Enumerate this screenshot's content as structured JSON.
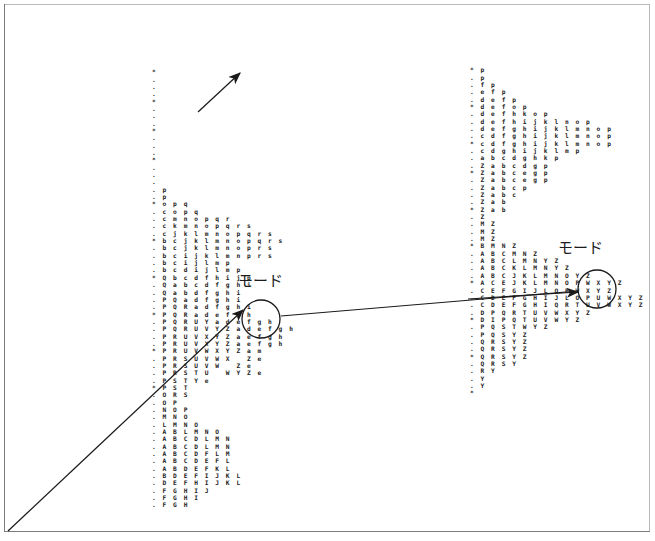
{
  "figure": {
    "title": "",
    "background_color": "#ffffff",
    "ink_color": "#1a1a1a",
    "frame_color": "#7d7d7d"
  },
  "annotations": {
    "left_label": "モード",
    "right_label": "モード",
    "left_label_romaji": "mōdo",
    "right_label_romaji": "mōdo"
  },
  "markers": {
    "left_circle": {
      "cx": 261,
      "cy": 319,
      "r": 19
    },
    "right_circle": {
      "cx": 597,
      "cy": 289,
      "r": 19
    },
    "leader_line": {
      "x1": 281,
      "y1": 316,
      "x2": 578,
      "y2": 291
    },
    "diagonal_arrow": {
      "x1": 8,
      "y1": 531,
      "x2": 243,
      "y2": 310
    },
    "upper_arrow": {
      "x1": 198,
      "y1": 112,
      "x2": 240,
      "y2": 73
    },
    "right_arrow": {
      "x1": 468,
      "y1": 299,
      "x2": 578,
      "y2": 292
    }
  },
  "ascii_maps": {
    "left": {
      "name": "left-mode-map",
      "char_rows": [
        "*",
        ".",
        ".",
        ".",
        "*",
        ".",
        ".",
        ".",
        "*",
        ".",
        ".",
        ".",
        "*",
        ".",
        ".",
        ".",
        ". p",
        ". p",
        "* o p q",
        ". c o p q",
        ". c m n o p q r",
        ". c k m n o p q r s",
        ". c j k l m n o p q r s",
        "* b c j k l m n o p q r s",
        ". b c j k l m n o p r s",
        ". b c i j k l m n p r s",
        ". b c i j l m p",
        ". b c d i j l m p",
        "* Q b c d f h i j p",
        ". Q a b c d f g h i",
        ". Q a b d f g h i",
        ". P Q a d f g h i",
        ". P Q R a d f g h i",
        "* P Q R a d e f g h",
        ". P Q R U Y a d e f g h",
        ". P Q R U V Y Z a d e f g h",
        ". P R U V X Y Z a e f g h",
        ". P R U V X Y Z a e f g h",
        "* P R U V W X Y Z a m",
        ". P R S U V W X   Z e",
        ". P R S U V W   Z e",
        ". P R S T U   W Y Z e",
        ". P S T Y e",
        "* P S T",
        ". O R S",
        ". O P",
        ". N O P",
        ". M N O",
        ". L M N O",
        ". A B L M N O",
        ". A B C D L M N",
        ". A B C D L M N",
        ". A B C D F L M",
        ". A B C D E F L",
        ". A B D E F K L",
        ". B D E F I J K L",
        ". D E F H I J K L",
        ". F G H I J",
        ". F G H I",
        ". F G H"
      ]
    },
    "right": {
      "name": "right-mode-map",
      "char_rows": [
        "* p",
        ". p",
        ". f p",
        ". e f p",
        ". d e f p",
        "* d e f o p",
        ". d e f h k o p",
        ". d e f h i j k l n o p",
        ". d e f g h i j k l m n o p",
        ". c d f g h i j k l m n o p",
        "* c d f g h i j k l m n o p",
        ". c d g h i j k l m p",
        ". a b c d g h k p",
        ". Z a b c d g p",
        "* Z a b c e g p",
        ". Z a b c e g p",
        ". Z a b c p",
        ". Z a b c",
        ". Z a b",
        "* Z a b",
        ". Z",
        ". M Z",
        ". M Z",
        ". M Z",
        "* B M N Z",
        ". A B C M N Z",
        ". A B C L M N Y Z",
        ". A B C K L M N Y Z",
        ". A B C J K L M N O Y Z",
        "* A C E J K L M N O P W X Y Z",
        ". C E F G I J L O P W X Y Z",
        ". C D E F G H I J L O P U W X Y Z",
        ". C D E F G H I Q R T U V W X Y Z",
        ". D P Q R T U V W X Y Z",
        "* D I P Q T U V W Y Z",
        ". P Q S T W Y Z",
        ". P Q S Y Z",
        ". Q R S Y Z",
        ". Q R S Y Z",
        "* Q R S Y Z",
        ". Q R S Y",
        ". R Y",
        ". Y",
        ". Y",
        "*"
      ]
    }
  },
  "chart_data": {
    "type": "heatmap",
    "title": "",
    "xlabel": "",
    "ylabel": "",
    "panels": [
      {
        "name": "left-mode-map",
        "rows": 59,
        "tick_marker": "*",
        "minor_marker": "."
      },
      {
        "name": "right-mode-map",
        "rows": 45,
        "tick_marker": "*",
        "minor_marker": "."
      }
    ],
    "legend": [],
    "grid": false
  }
}
